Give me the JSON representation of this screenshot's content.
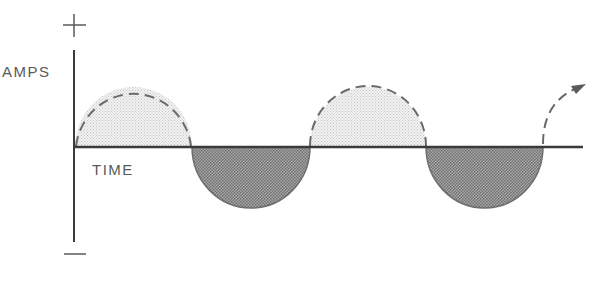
{
  "diagram": {
    "y_axis": {
      "label": "AMPS",
      "positive_symbol": "+",
      "negative_symbol": "—"
    },
    "x_axis": {
      "label": "TIME"
    },
    "waveform": {
      "type": "sine",
      "positive_half_style": "dashed outline, light stipple fill",
      "negative_half_style": "solid outline, dark checker fill",
      "half_cycles": [
        {
          "polarity": "positive",
          "start_x": 74,
          "end_x": 192
        },
        {
          "polarity": "negative",
          "start_x": 192,
          "end_x": 310
        },
        {
          "polarity": "positive",
          "start_x": 310,
          "end_x": 426
        },
        {
          "polarity": "negative",
          "start_x": 426,
          "end_x": 543
        },
        {
          "polarity": "positive-partial",
          "start_x": 543,
          "continues": "arrow"
        }
      ]
    },
    "colors": {
      "axis": "#3a3a3a",
      "positive_fill": "#e4e4e4",
      "negative_fill": "#8c8c8c",
      "dash_stroke": "#6a6a6a",
      "label_text": "#5a5a5a"
    }
  }
}
